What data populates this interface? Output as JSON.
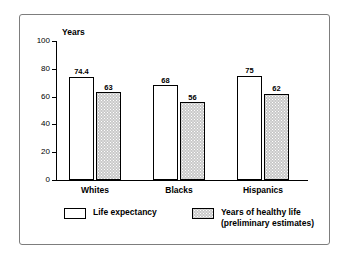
{
  "chart_data": {
    "type": "bar",
    "title": "",
    "xlabel": "",
    "ylabel": "Years",
    "ylim": [
      0,
      100
    ],
    "yticks": [
      0,
      20,
      40,
      60,
      80,
      100
    ],
    "ytick_labels": [
      "0",
      "20",
      "40",
      "60",
      "80",
      "100"
    ],
    "grid": false,
    "legend_position": "bottom",
    "categories": [
      "Whites",
      "Blacks",
      "Hispanics"
    ],
    "series": [
      {
        "name": "Life expectancy",
        "style": "light",
        "values": [
          74.4,
          68,
          75
        ],
        "labels": [
          "74.4",
          "68",
          "75"
        ]
      },
      {
        "name": "Years of healthy life",
        "name_line2": "(preliminary estimates)",
        "style": "shaded",
        "values": [
          63,
          56,
          62
        ],
        "labels": [
          "63",
          "56",
          "62"
        ]
      }
    ],
    "colors": {
      "light_fill": "#ffffff",
      "shaded_fill": "#c9c9c9",
      "outline": "#000000",
      "frame": "#7d7d7d",
      "background": "#ffffff"
    }
  }
}
